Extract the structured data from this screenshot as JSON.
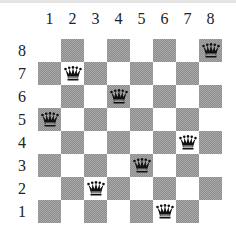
{
  "columns": [
    "1",
    "2",
    "3",
    "4",
    "5",
    "6",
    "7",
    "8"
  ],
  "rows": [
    "8",
    "7",
    "6",
    "5",
    "4",
    "3",
    "2",
    "1"
  ],
  "queens": [
    {
      "row": "8",
      "col": "8"
    },
    {
      "row": "7",
      "col": "2"
    },
    {
      "row": "6",
      "col": "4"
    },
    {
      "row": "5",
      "col": "1"
    },
    {
      "row": "4",
      "col": "7"
    },
    {
      "row": "3",
      "col": "5"
    },
    {
      "row": "2",
      "col": "3"
    },
    {
      "row": "1",
      "col": "6"
    }
  ],
  "colors": {
    "dark_square": "#a0a0a0",
    "light_square": "#ffffff",
    "queen": "#111111"
  },
  "piece_icon": "queen-icon"
}
